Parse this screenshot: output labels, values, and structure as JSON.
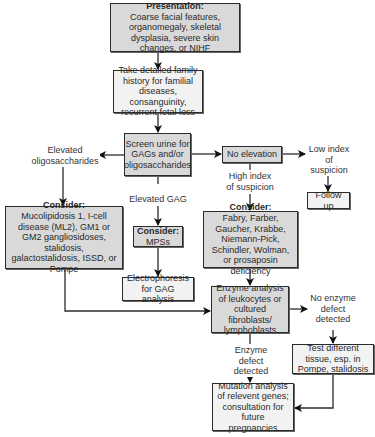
{
  "nodes": {
    "presentation": {
      "title": "Presentation:",
      "text": "Coarse facial features, organomegaly, skeletal dysplasia, severe skin changes, or NIHF"
    },
    "family_history": {
      "text": "Take detailed family history for familial diseases, consanguinity, recurrent fetal loss"
    },
    "screen_urine": {
      "text": "Screen urine for GAGs and/or oligosaccharides"
    },
    "no_elevation": {
      "text": "No elevation"
    },
    "follow_up": {
      "text": "Follow up"
    },
    "consider_oligo": {
      "title": "Consider:",
      "text": "Mucolipidosis 1, I-cell disease (ML2), GM1 or GM2 gangliosidoses, stalidosis, galactostalidosis, ISSD, or Pompe"
    },
    "consider_mps": {
      "title": "Consider:",
      "text": "MPSs"
    },
    "consider_lsd": {
      "title": "Consider:",
      "text": "Fabry, Farber, Gaucher, Krabbe, Niemann-Pick, Schindler, Wolman, or prosaposin deficiency"
    },
    "electrophoresis": {
      "text": "Electrophoresis for GAG analysis"
    },
    "enzyme_analysis": {
      "text": "Enzyme analysis of leukocytes or cultured fibroblasts/ lymphoblasts"
    },
    "test_tissue": {
      "text": "Test different tissue, esp. in Pompe, stalidosis"
    },
    "mutation_analysis": {
      "text": "Mutation analysis of relevent genes; consultation for future pregnancies"
    }
  },
  "edge_labels": {
    "elevated_oligo": "Elevated oligosaccharides",
    "elevated_gag": "Elevated GAG",
    "low_index": "Low index of suspicion",
    "high_index": "High index of suspicion",
    "no_enzyme_defect": "No enzyme defect detected",
    "enzyme_defect": "Enzyme defect detected"
  },
  "colors": {
    "primary_box": "#d9d9d9",
    "secondary_box": "#f2f2f2",
    "line": "#2b2b2b"
  }
}
